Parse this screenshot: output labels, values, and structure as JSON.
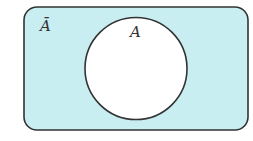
{
  "diagram": {
    "type": "venn",
    "universe": {
      "label": "Ā",
      "fill": "#c8eef2",
      "stroke": "#333333",
      "shaded": true
    },
    "sets": [
      {
        "name": "A",
        "label": "A",
        "fill": "#ffffff",
        "stroke": "#333333",
        "shaded": false
      }
    ]
  }
}
